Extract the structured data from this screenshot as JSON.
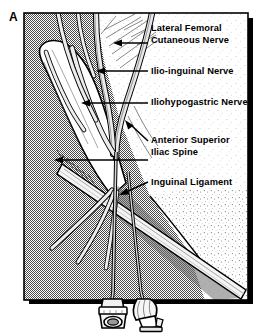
{
  "figure": {
    "panel_letter": "A",
    "alt": "Anatomic illustration of the anterior superior iliac spine region showing ilioinguinal and iliohypogastric nerve block needle placement"
  },
  "labels": [
    {
      "id": "lateral-femoral-cutaneous-nerve",
      "lines": [
        "Lateral  Femoral",
        "Cutaneous Nerve"
      ],
      "line1": "Lateral  Femoral",
      "line2": "Cutaneous Nerve"
    },
    {
      "id": "ilio-inguinal-nerve",
      "lines": [
        "Ilio-inguinal Nerve"
      ],
      "line1": "Ilio-inguinal Nerve",
      "line2": ""
    },
    {
      "id": "iliohypogastric-nerve",
      "lines": [
        "Iliohypogastric Nerve"
      ],
      "line1": "Iliohypogastric Nerve",
      "line2": ""
    },
    {
      "id": "anterior-superior-iliac-spine",
      "lines": [
        "Anterior Superior",
        "Iliac Spine"
      ],
      "line1": "Anterior Superior",
      "line2": "Iliac Spine"
    },
    {
      "id": "inguinal-ligament",
      "lines": [
        "Inguinal Ligament"
      ],
      "line1": "Inguinal Ligament",
      "line2": ""
    }
  ],
  "colors": {
    "ink": "#000000",
    "paper": "#ffffff",
    "background_gray": "#a8a8a8",
    "tissue_light": "#f2f2f2",
    "nerve_fill": "#d9d9d9",
    "shadow": "#000000"
  }
}
